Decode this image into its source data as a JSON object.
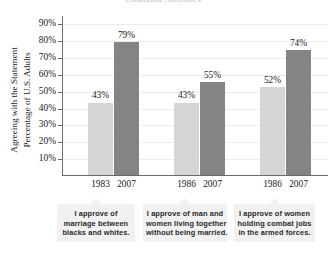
{
  "chart_data": {
    "type": "bar",
    "title": "",
    "xlabel": "",
    "ylabel": "Percentage of U.S. Adults Agreeing with the Statement",
    "ylabel_line1": "Percentage of U.S. Adults",
    "ylabel_line2": "Agreeing with the Statement",
    "ylim": [
      0,
      95
    ],
    "yticks": [
      "10%",
      "20%",
      "30%",
      "40%",
      "50%",
      "60%",
      "70%",
      "80%",
      "90%"
    ],
    "ytick_values": [
      10,
      20,
      30,
      40,
      50,
      60,
      70,
      80,
      90
    ],
    "grid": true,
    "legend_position": "below-as-callouts",
    "categories": [
      "I approve of marriage between blacks and whites.",
      "I approve of man and women living together without being married.",
      "I approve of women holding combat jobs in the armed forces."
    ],
    "series": [
      {
        "name": "earlier year",
        "values": [
          43,
          43,
          52
        ],
        "color": "#d5d5d5"
      },
      {
        "name": "2007",
        "values": [
          79,
          55,
          74
        ],
        "color": "#848484"
      }
    ],
    "bars": [
      {
        "group": 0,
        "year": "1983",
        "value": 43,
        "label": "43%",
        "tone": "light"
      },
      {
        "group": 0,
        "year": "2007",
        "value": 79,
        "label": "79%",
        "tone": "dark"
      },
      {
        "group": 1,
        "year": "1986",
        "value": 43,
        "label": "43%",
        "tone": "light"
      },
      {
        "group": 1,
        "year": "2007",
        "value": 55,
        "label": "55%",
        "tone": "dark"
      },
      {
        "group": 2,
        "year": "1986",
        "value": 52,
        "label": "52%",
        "tone": "light"
      },
      {
        "group": 2,
        "year": "2007",
        "value": 74,
        "label": "74%",
        "tone": "dark"
      }
    ],
    "callouts": [
      {
        "lines": [
          "I approve of",
          "marriage between",
          "blacks and whites."
        ]
      },
      {
        "lines": [
          "I approve of man and",
          "women living together",
          "without being married."
        ]
      },
      {
        "lines": [
          "I approve of women",
          "holding combat jobs",
          "in the armed forces."
        ]
      }
    ],
    "colors": {
      "light_bar": "#d5d5d5",
      "dark_bar": "#848484",
      "axis": "#6b6b6b",
      "grid": "#ededed",
      "callout_bg": "#f1f1f1",
      "text": "#1a1a1a"
    }
  },
  "title_remnant": "Changing Attitudes"
}
